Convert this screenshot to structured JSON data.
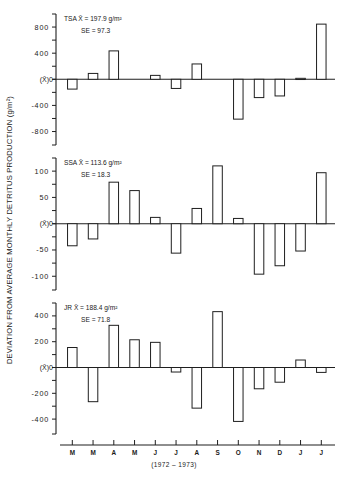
{
  "chart_data": {
    "type": "bar",
    "title": "",
    "ylabel": "DEVIATION FROM AVERAGE MONTHLY DETRITUS PRODUCTION (g/m²)",
    "xlabel": "(1972 – 1973)",
    "categories": [
      "M",
      "M",
      "A",
      "M",
      "J",
      "J",
      "A",
      "S",
      "O",
      "N",
      "D",
      "J",
      "J"
    ],
    "grid": false,
    "panels": [
      {
        "name": "TSA",
        "mean_label": "TSA   X̄ = 197.9 g/m²",
        "se_label": "SE =  97.3",
        "station": "TSA",
        "mean": 197.9,
        "se": 97.3,
        "zero_label": "(X̄)0",
        "ylim": [
          -1000,
          1000
        ],
        "yticks_major": [
          800,
          400,
          -400,
          -800
        ],
        "ytick_labels": [
          "800",
          "400",
          "-400",
          "-800"
        ],
        "ytick_minor_step": 200,
        "values": [
          -150,
          90,
          435,
          0,
          60,
          -140,
          235,
          10,
          -610,
          -280,
          -255,
          15,
          845
        ]
      },
      {
        "name": "SSA",
        "mean_label": "SSA   X̄ = 113.6 g/m²",
        "se_label": "SE =  18.3",
        "station": "SSA",
        "mean": 113.6,
        "se": 18.3,
        "zero_label": "(X̄)0",
        "ylim": [
          -125,
          125
        ],
        "yticks_major": [
          100,
          50,
          -50,
          -100
        ],
        "ytick_labels": [
          "100",
          "50",
          "-50",
          "-100"
        ],
        "ytick_minor_step": 25,
        "values": [
          -42,
          -29,
          79,
          63,
          12,
          -56,
          29,
          110,
          10,
          -96,
          -80,
          -52,
          97
        ]
      },
      {
        "name": "JR",
        "mean_label": "JR   X̄ = 188.4 g/m²",
        "se_label": "SE =  71.8",
        "station": "JR",
        "mean": 188.4,
        "se": 71.8,
        "zero_label": "(X̄)0",
        "ylim": [
          -500,
          500
        ],
        "yticks_major": [
          400,
          200,
          -200,
          -400
        ],
        "ytick_labels": [
          "400",
          "200",
          "-200",
          "-400"
        ],
        "ytick_minor_step": 100,
        "values": [
          155,
          -265,
          327,
          215,
          195,
          -35,
          -315,
          433,
          -418,
          -165,
          -114,
          58,
          -38
        ]
      }
    ]
  },
  "figure": {
    "ylabel": "DEVIATION FROM AVERAGE MONTHLY DETRITUS PRODUCTION  (g/m²)",
    "xcaption": "(1972 – 1973)"
  }
}
